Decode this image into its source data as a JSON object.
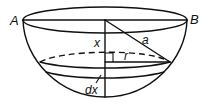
{
  "diagram": {
    "labels": {
      "point_a": "A",
      "point_b": "B",
      "depth": "x",
      "radius_sphere": "a",
      "radius_slice": "r",
      "slice_thickness": "dx"
    },
    "elements": [
      "top rim ellipse through A and B",
      "diameter AB",
      "hemisphere outer arc",
      "vertical axis from centre",
      "slanted radius a from centre to slice edge",
      "dashed back edge of slice ellipse",
      "slice radius r with right-angle marker",
      "thin slice of thickness dx"
    ],
    "colors": {
      "ink": "#111111",
      "background": "#ffffff"
    }
  }
}
